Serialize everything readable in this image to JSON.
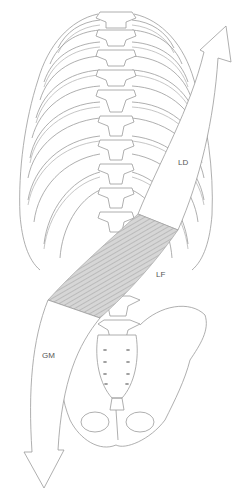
{
  "figure": {
    "colors": {
      "line": "#9a9a9a",
      "fascia_fill": "#cfcfcf",
      "fascia_stripe": "#a8a8a8",
      "label": "#555555",
      "background": "#ffffff"
    },
    "labels": {
      "ld": "LD",
      "lf": "LF",
      "gm": "GM"
    }
  }
}
